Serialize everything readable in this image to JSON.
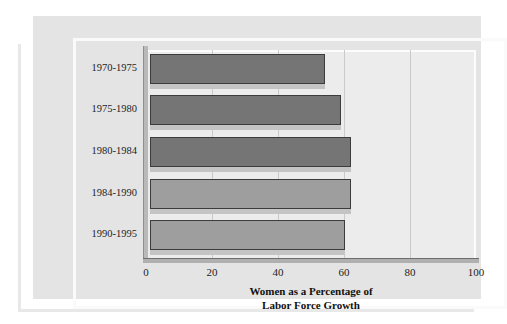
{
  "chart_data": {
    "type": "bar",
    "orientation": "horizontal",
    "title": "",
    "xlabel": "Women as a Percentage of Labor Force Growth",
    "xlabel_lines": [
      "Women as a Percentage of",
      "Labor Force Growth"
    ],
    "ylabel": "",
    "categories": [
      "1970-1975",
      "1975-1980",
      "1980-1984",
      "1984-1990",
      "1990-1995"
    ],
    "values": [
      53,
      58,
      61,
      61,
      59
    ],
    "xlim": [
      0,
      100
    ],
    "xticks": [
      0,
      20,
      40,
      60,
      80,
      100
    ],
    "xtick_labels": [
      "0",
      "20",
      "40",
      "60",
      "80",
      "100"
    ],
    "grid": "vertical",
    "legend": "none",
    "bar_colors": [
      "#757575",
      "#757575",
      "#757575",
      "#9e9e9e",
      "#9e9e9e"
    ]
  },
  "figure": {
    "panel_color": "#e4e4e4",
    "plot_bg_color": "#ececec",
    "frame_color": "#fafafa",
    "gridline_color": "#c9c9c9",
    "axis_color": "#6e6e6e",
    "text_color": "#1d1d1d"
  }
}
